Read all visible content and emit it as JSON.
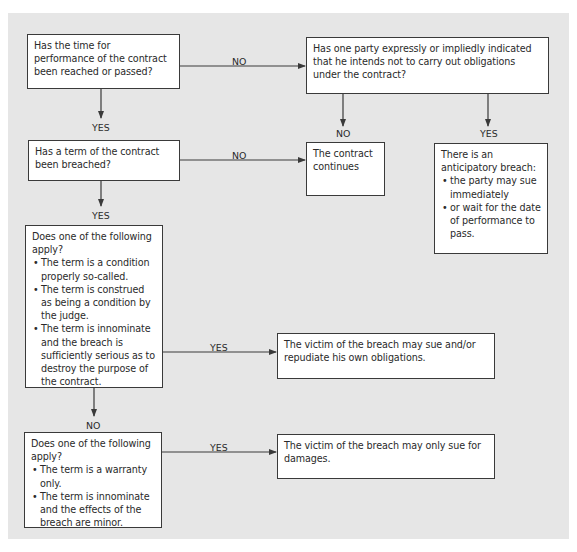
{
  "flowchart": {
    "nodes": {
      "q_time": {
        "text": "Has the time for performance of the contract been reached or passed?"
      },
      "q_indicated": {
        "text": "Has one party expressly or impliedly indicated that he intends not to carry out obligations under the contract?"
      },
      "r_continues": {
        "text": "The contract continues"
      },
      "r_anticipatory": {
        "heading": "There is an anticipatory breach:",
        "bullets": [
          "the party may sue immediately",
          "or wait for the date of performance to pass."
        ]
      },
      "q_breached": {
        "text": "Has a term of the contract been breached?"
      },
      "q_condition": {
        "heading": "Does one of the following apply?",
        "bullets": [
          "The term is a condition properly so-called.",
          "The term is construed as being a condition by the judge.",
          "The term is innominate and the breach is sufficiently serious as to destroy the purpose of the contract."
        ]
      },
      "r_repudiate": {
        "text": "The victim of the breach may sue and/or repudiate his own obligations."
      },
      "q_warranty": {
        "heading": "Does one of the following apply?",
        "bullets": [
          "The term is a warranty only.",
          "The term is innominate and the effects of the breach are minor."
        ]
      },
      "r_damages": {
        "text": "The victim of the breach may only sue for damages."
      }
    },
    "edges": [
      {
        "from": "q_time",
        "to": "q_indicated",
        "label": "NO"
      },
      {
        "from": "q_time",
        "to": "q_breached",
        "label": "YES"
      },
      {
        "from": "q_indicated",
        "to": "r_continues",
        "label": "NO"
      },
      {
        "from": "q_indicated",
        "to": "r_anticipatory",
        "label": "YES"
      },
      {
        "from": "q_breached",
        "to": "r_continues",
        "label": "NO"
      },
      {
        "from": "q_breached",
        "to": "q_condition",
        "label": "YES"
      },
      {
        "from": "q_condition",
        "to": "r_repudiate",
        "label": "YES"
      },
      {
        "from": "q_condition",
        "to": "q_warranty",
        "label": "NO"
      },
      {
        "from": "q_warranty",
        "to": "r_damages",
        "label": "YES"
      }
    ]
  },
  "colors": {
    "panel_background": "#e6e6e6",
    "box_fill": "#ffffff",
    "line": "#3a3a3a"
  }
}
